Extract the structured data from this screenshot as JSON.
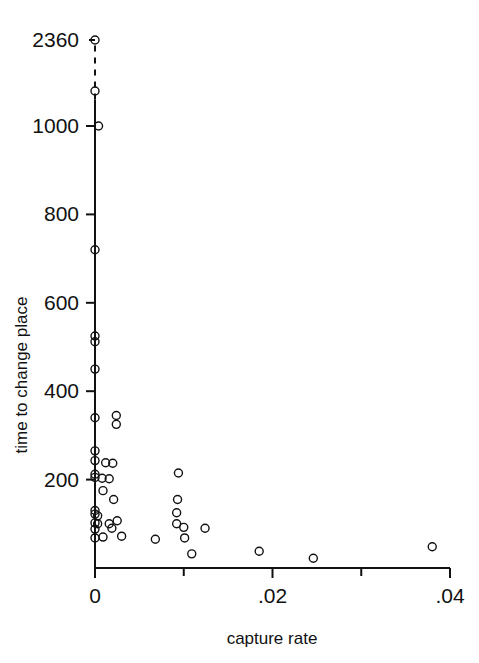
{
  "figure": {
    "header_ghost_text": "",
    "background_color": "#ffffff",
    "ink_color": "#111111"
  },
  "axes": {
    "x_axis_title": "capture rate",
    "y_axis_title": "time to change place",
    "x_tick_labels": [
      "0",
      ".02",
      ".04"
    ],
    "x_tick_values": [
      0,
      0.02,
      0.04
    ],
    "x_minor_tick_values": [
      0.01,
      0.03
    ],
    "y_tick_labels": [
      "200",
      "400",
      "600",
      "800",
      "1000",
      "2360"
    ],
    "y_tick_values": [
      200,
      400,
      600,
      800,
      1000,
      2360
    ],
    "y_break_note": "dashed axis break between 1000 and 2360"
  },
  "chart_data": {
    "type": "scatter",
    "title": "",
    "xlabel": "capture rate",
    "ylabel": "time to change place",
    "xlim": [
      0,
      0.0405
    ],
    "ylim": [
      0,
      2360
    ],
    "grid": false,
    "legend": "none",
    "marker": "open-circle",
    "axis_break": {
      "axis": "y",
      "from": 1060,
      "to": 2300,
      "style": "dashed",
      "top_label": "2360"
    },
    "points": [
      {
        "x": 0.0,
        "y": 2360
      },
      {
        "x": 0.0,
        "y": 1245
      },
      {
        "x": 0.0004,
        "y": 1000
      },
      {
        "x": 0.0,
        "y": 720
      },
      {
        "x": 0.0,
        "y": 525
      },
      {
        "x": 0.0,
        "y": 512
      },
      {
        "x": 0.0,
        "y": 450
      },
      {
        "x": 0.0,
        "y": 340
      },
      {
        "x": 0.0024,
        "y": 345
      },
      {
        "x": 0.0024,
        "y": 325
      },
      {
        "x": 0.0,
        "y": 265
      },
      {
        "x": 0.0,
        "y": 243
      },
      {
        "x": 0.0012,
        "y": 238
      },
      {
        "x": 0.002,
        "y": 237
      },
      {
        "x": 0.0,
        "y": 212
      },
      {
        "x": 0.0,
        "y": 205
      },
      {
        "x": 0.0008,
        "y": 203
      },
      {
        "x": 0.0016,
        "y": 202
      },
      {
        "x": 0.0094,
        "y": 215
      },
      {
        "x": 0.0009,
        "y": 175
      },
      {
        "x": 0.0021,
        "y": 155
      },
      {
        "x": 0.0093,
        "y": 155
      },
      {
        "x": 0.0,
        "y": 130
      },
      {
        "x": 0.0,
        "y": 122
      },
      {
        "x": 0.0003,
        "y": 118
      },
      {
        "x": 0.0092,
        "y": 125
      },
      {
        "x": 0.0,
        "y": 102
      },
      {
        "x": 0.0003,
        "y": 100
      },
      {
        "x": 0.0016,
        "y": 100
      },
      {
        "x": 0.0025,
        "y": 107
      },
      {
        "x": 0.0092,
        "y": 100
      },
      {
        "x": 0.0,
        "y": 88
      },
      {
        "x": 0.0019,
        "y": 90
      },
      {
        "x": 0.01,
        "y": 92
      },
      {
        "x": 0.0124,
        "y": 90
      },
      {
        "x": 0.0,
        "y": 68
      },
      {
        "x": 0.0009,
        "y": 70
      },
      {
        "x": 0.003,
        "y": 72
      },
      {
        "x": 0.0101,
        "y": 68
      },
      {
        "x": 0.0068,
        "y": 65
      },
      {
        "x": 0.0109,
        "y": 32
      },
      {
        "x": 0.0185,
        "y": 38
      },
      {
        "x": 0.0246,
        "y": 22
      },
      {
        "x": 0.038,
        "y": 48
      }
    ]
  }
}
